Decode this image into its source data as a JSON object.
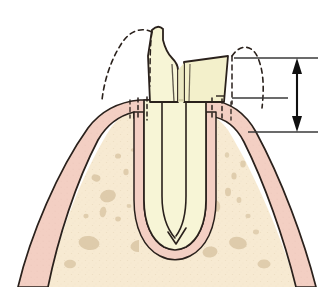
{
  "figure": {
    "type": "medical-anatomical-illustration",
    "width": 332,
    "height": 287,
    "background_color": "#ffffff"
  },
  "colors": {
    "background": "#ffffff",
    "tooth_enamel": "#f7f5d6",
    "tooth_dentin": "#f3f0cb",
    "tooth_shadow": "#e8e4b8",
    "gingiva": "#f3cfc3",
    "gingiva_dark": "#eec2b4",
    "periodontal_ligament": "#f3cfc3",
    "bone": "#f7ead2",
    "bone_spot": "#d9c6a4",
    "outline": "#2a211c",
    "dashed_outline": "#2a211c",
    "measurement_line": "#3a3a3a",
    "arrow": "#101010"
  },
  "structures": [
    {
      "id": "tooth-crown-fragment-left",
      "label": "Fractured tooth crown fragment (mesial)",
      "fill": "#f7f5d6"
    },
    {
      "id": "tooth-crown-fragment-right",
      "label": "Fractured tooth crown fragment (distal)",
      "fill": "#f3f0cb"
    },
    {
      "id": "tooth-root",
      "label": "Tooth root with root canal",
      "fill": "#f7f5d6"
    },
    {
      "id": "root-canal",
      "label": "Root canal space",
      "fill": "#f7f5d6"
    },
    {
      "id": "gingiva-left",
      "label": "Gingiva (gum tissue), mesial",
      "fill": "#f3cfc3"
    },
    {
      "id": "gingiva-right",
      "label": "Gingiva (gum tissue), distal",
      "fill": "#f3cfc3"
    },
    {
      "id": "alveolar-bone",
      "label": "Alveolar bone with trabecular pattern",
      "fill": "#f7ead2"
    },
    {
      "id": "periodontal-ligament-space",
      "label": "Periodontal ligament space surrounding root",
      "fill": "#f3cfc3"
    },
    {
      "id": "original-crown-outline-left",
      "label": "Dashed outline of original crown contour (mesial)",
      "stroke_style": "dashed"
    },
    {
      "id": "original-crown-outline-right",
      "label": "Dashed outline of original crown contour (distal)",
      "stroke_style": "dashed"
    },
    {
      "id": "sulcus-dashes-left",
      "label": "Dashed sulcus / pocket depth marks, mesial",
      "stroke_style": "dashed"
    },
    {
      "id": "sulcus-dashes-right",
      "label": "Dashed sulcus / pocket depth marks, distal",
      "stroke_style": "dashed"
    }
  ],
  "measurement": {
    "id": "vertical-dimension-arrow",
    "label": "Vertical measurement arrow (double-headed)",
    "reference_lines": [
      {
        "id": "reference-line-top",
        "label": "Upper reference line (original crown height)"
      },
      {
        "id": "reference-line-middle",
        "label": "Middle reference line (gingival margin)"
      },
      {
        "id": "reference-line-bottom",
        "label": "Lower reference line (bone crest)"
      }
    ],
    "arrow_color": "#101010"
  },
  "bone_spots": [
    {
      "cx": 96,
      "cy": 178,
      "rx": 4.5,
      "ry": 3.4,
      "rot": 20
    },
    {
      "cx": 108,
      "cy": 196,
      "rx": 8.0,
      "ry": 6.2,
      "rot": -15
    },
    {
      "cx": 103,
      "cy": 210,
      "rx": 3.2,
      "ry": 5.4,
      "rot": 10
    },
    {
      "cx": 86,
      "cy": 216,
      "rx": 2.6,
      "ry": 2.2,
      "rot": 0
    },
    {
      "cx": 118,
      "cy": 219,
      "rx": 2.8,
      "ry": 2.4,
      "rot": 0
    },
    {
      "cx": 129,
      "cy": 206,
      "rx": 2.4,
      "ry": 2.0,
      "rot": 0
    },
    {
      "cx": 126,
      "cy": 172,
      "rx": 2.6,
      "ry": 3.2,
      "rot": 0
    },
    {
      "cx": 118,
      "cy": 156,
      "rx": 3.0,
      "ry": 2.6,
      "rot": 0
    },
    {
      "cx": 133,
      "cy": 150,
      "rx": 2.2,
      "ry": 1.8,
      "rot": 0
    },
    {
      "cx": 89,
      "cy": 243,
      "rx": 10.5,
      "ry": 7.0,
      "rot": 8
    },
    {
      "cx": 139,
      "cy": 246,
      "rx": 8.5,
      "ry": 6.0,
      "rot": -8
    },
    {
      "cx": 178,
      "cy": 253,
      "rx": 11.5,
      "ry": 7.5,
      "rot": 5
    },
    {
      "cx": 210,
      "cy": 252,
      "rx": 7.5,
      "ry": 5.5,
      "rot": -6
    },
    {
      "cx": 238,
      "cy": 243,
      "rx": 9.0,
      "ry": 6.2,
      "rot": 12
    },
    {
      "cx": 205,
      "cy": 222,
      "rx": 3.4,
      "ry": 5.0,
      "rot": 6
    },
    {
      "cx": 216,
      "cy": 206,
      "rx": 4.2,
      "ry": 5.8,
      "rot": -8
    },
    {
      "cx": 228,
      "cy": 192,
      "rx": 3.0,
      "ry": 4.2,
      "rot": 0
    },
    {
      "cx": 239,
      "cy": 200,
      "rx": 2.4,
      "ry": 3.0,
      "rot": 0
    },
    {
      "cx": 234,
      "cy": 176,
      "rx": 2.6,
      "ry": 3.6,
      "rot": 0
    },
    {
      "cx": 243,
      "cy": 164,
      "rx": 2.8,
      "ry": 3.4,
      "rot": 0
    },
    {
      "cx": 227,
      "cy": 155,
      "rx": 2.2,
      "ry": 2.8,
      "rot": 0
    },
    {
      "cx": 248,
      "cy": 216,
      "rx": 2.6,
      "ry": 2.2,
      "rot": 0
    },
    {
      "cx": 190,
      "cy": 228,
      "rx": 2.4,
      "ry": 2.0,
      "rot": 0
    },
    {
      "cx": 256,
      "cy": 232,
      "rx": 3.0,
      "ry": 2.4,
      "rot": 0
    },
    {
      "cx": 70,
      "cy": 262,
      "rx": 6.0,
      "ry": 4.2,
      "rot": 0
    },
    {
      "cx": 264,
      "cy": 262,
      "rx": 6.5,
      "ry": 4.4,
      "rot": 0
    }
  ]
}
